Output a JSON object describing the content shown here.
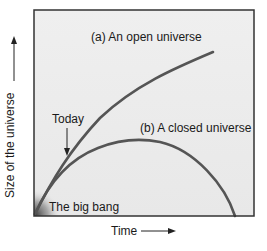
{
  "diagram": {
    "x_axis_label": "Time",
    "y_axis_label": "Size of the universe",
    "curves": [
      {
        "id": "open",
        "label": "(a) An open universe",
        "color": "#555555"
      },
      {
        "id": "closed",
        "label": "(b) A closed universe",
        "color": "#555555"
      }
    ],
    "annotations": {
      "today": "Today",
      "big_bang": "The big bang"
    },
    "colors": {
      "plot_background": "#ececec",
      "frame": "#333333",
      "curve": "#555555",
      "text": "#1a1a1a"
    }
  }
}
